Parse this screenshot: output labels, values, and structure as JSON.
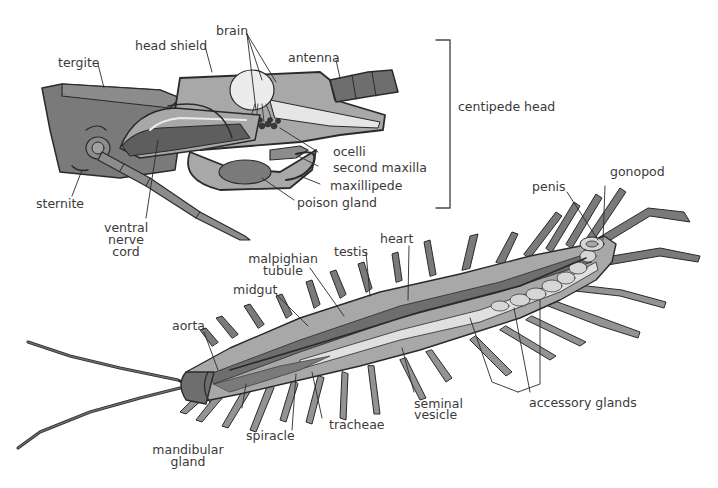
{
  "diagram": {
    "colors": {
      "background": "#ffffff",
      "outline": "#2a2a2a",
      "dark_gray": "#6e6e6e",
      "mid_gray": "#939393",
      "light_gray": "#bdbdbd",
      "pale": "#e4e4e4",
      "label_text": "#3a3a3a"
    },
    "head_group": {
      "bracket_label": "centipede head",
      "labels": {
        "tergite": "tergite",
        "head_shield": "head shield",
        "brain": "brain",
        "antenna": "antenna",
        "ocelli": "ocelli",
        "second_maxilla": "second maxilla",
        "maxillipede": "maxillipede",
        "poison_gland": "poison gland",
        "sternite": "sternite",
        "ventral_nerve_cord_1": "ventral",
        "ventral_nerve_cord_2": "nerve",
        "ventral_nerve_cord_3": "cord"
      }
    },
    "body_group": {
      "labels": {
        "gonopod": "gonopod",
        "penis": "penis",
        "heart": "heart",
        "testis": "testis",
        "malpighian_tubule_1": "malpighian",
        "malpighian_tubule_2": "tubule",
        "midgut": "midgut",
        "aorta": "aorta",
        "mandibular_gland_1": "mandibular",
        "mandibular_gland_2": "gland",
        "spiracle": "spiracle",
        "tracheae": "tracheae",
        "seminal_vesicle_1": "seminal",
        "seminal_vesicle_2": "vesicle",
        "accessory_glands": "accessory glands"
      }
    }
  }
}
